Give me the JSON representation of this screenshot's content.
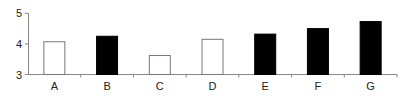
{
  "chart_data": {
    "type": "bar",
    "title": "",
    "xlabel": "",
    "ylabel": "",
    "categories": [
      "A",
      "B",
      "C",
      "D",
      "E",
      "F",
      "G"
    ],
    "values": [
      4.07,
      4.25,
      3.62,
      4.15,
      4.32,
      4.5,
      4.73
    ],
    "bar_fill": [
      "white",
      "black",
      "white",
      "white",
      "black",
      "black",
      "black"
    ],
    "ylim": [
      3,
      5
    ],
    "yticks": [
      3,
      4,
      5
    ],
    "grid": false,
    "legend": null
  },
  "colors": {
    "axis": "#888888",
    "bar_filled": "#000000",
    "bar_empty": "#ffffff",
    "bar_outline": "#777777",
    "text": "#222222"
  }
}
